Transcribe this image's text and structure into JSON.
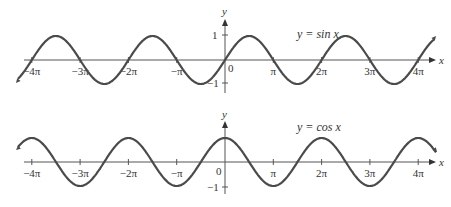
{
  "chart_data": [
    {
      "type": "line",
      "title": "y = sin x",
      "function": "sin",
      "xlabel": "x",
      "ylabel": "y",
      "xlim": [
        -12.9,
        13.0
      ],
      "ylim": [
        -1,
        1
      ],
      "x_ticks": [
        "-4π",
        "-3π",
        "-2π",
        "-π",
        "0",
        "π",
        "2π",
        "3π",
        "4π"
      ],
      "y_ticks": [
        "1",
        "-1"
      ],
      "grid": false,
      "annotation": "y = sin x"
    },
    {
      "type": "line",
      "title": "y = cos x",
      "function": "cos",
      "xlabel": "x",
      "ylabel": "y",
      "xlim": [
        -12.9,
        13.0
      ],
      "ylim": [
        -1,
        1
      ],
      "x_ticks": [
        "-4π",
        "-3π",
        "-2π",
        "-π",
        "0",
        "π",
        "2π",
        "3π",
        "4π"
      ],
      "y_ticks": [
        "-1"
      ],
      "grid": false,
      "annotation": "y = cos x"
    }
  ],
  "plots": {
    "sin": {
      "label_y": "y",
      "label_x": "x",
      "equation": "y = sin x",
      "tick_one": "1",
      "tick_neg_one": "−1",
      "origin": "0",
      "xticks": [
        "−4π",
        "−3π",
        "−2π",
        "−π",
        "π",
        "2π",
        "3π",
        "4π"
      ]
    },
    "cos": {
      "label_y": "y",
      "label_x": "x",
      "equation": "y = cos x",
      "tick_neg_one": "−1",
      "origin": "0",
      "xticks": [
        "−4π",
        "−3π",
        "−2π",
        "−π",
        "π",
        "2π",
        "3π",
        "4π"
      ]
    }
  },
  "colors": {
    "curve": "#4a4a4a",
    "axis": "#555555"
  }
}
